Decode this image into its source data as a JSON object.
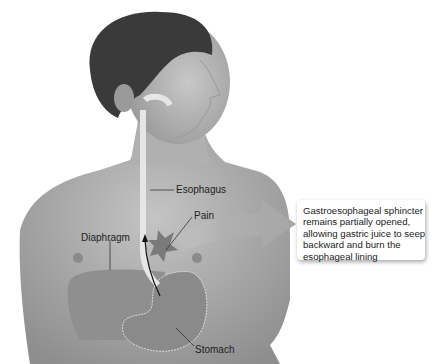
{
  "figure": {
    "labels": {
      "esophagus": "Esophagus",
      "pain": "Pain",
      "diaphragm": "Diaphragm",
      "stomach": "Stomach"
    },
    "callout": {
      "lines": [
        "Gastroesophageal sphincter",
        "remains partially opened,",
        "allowing gastric juice to seep",
        "backward and burn the",
        "esophageal lining"
      ]
    },
    "colors": {
      "skin": "#b5b5b5",
      "skin_dark": "#8a8a8a",
      "hair": "#3a3a3a",
      "organ": "#8f8f8f",
      "esophagus": "#e6e6e6",
      "arrow": "#a9a9a9",
      "text": "#222222"
    }
  }
}
